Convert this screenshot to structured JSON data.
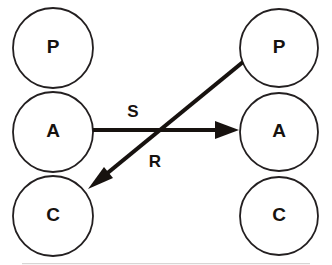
{
  "diagram": {
    "background_color": "#ffffff",
    "stroke_color": "#231f20",
    "edge_color": "#17120f",
    "left_stack": {
      "name": "left-agent",
      "nodes": [
        {
          "id": "left-p",
          "label": "P",
          "meaning": "Presentation",
          "cx": 53,
          "cy": 48,
          "r": 40
        },
        {
          "id": "left-a",
          "label": "A",
          "meaning": "Abstraction",
          "cx": 53,
          "cy": 132,
          "r": 40
        },
        {
          "id": "left-c",
          "label": "C",
          "meaning": "Control",
          "cx": 53,
          "cy": 216,
          "r": 40
        }
      ]
    },
    "right_stack": {
      "name": "right-agent",
      "nodes": [
        {
          "id": "right-p",
          "label": "P",
          "meaning": "Presentation",
          "cx": 279,
          "cy": 48,
          "r": 39
        },
        {
          "id": "right-a",
          "label": "A",
          "meaning": "Abstraction",
          "cx": 279,
          "cy": 132,
          "r": 39
        },
        {
          "id": "right-c",
          "label": "C",
          "meaning": "Control",
          "cx": 279,
          "cy": 216,
          "r": 39
        }
      ]
    },
    "edges": [
      {
        "id": "edge-send",
        "label": "S",
        "meaning": "Send",
        "from": "left-a",
        "to": "right-a",
        "direction": "left-to-right",
        "x1": 93,
        "y1": 130,
        "x2": 239,
        "y2": 130,
        "label_x": 133,
        "label_y": 113
      },
      {
        "id": "edge-receive",
        "label": "R",
        "meaning": "Receive",
        "from": "right-p",
        "to": "left-c",
        "direction": "right-to-left-diagonal",
        "x1": 243,
        "y1": 62,
        "x2": 88,
        "y2": 189,
        "label_x": 155,
        "label_y": 163
      }
    ]
  }
}
